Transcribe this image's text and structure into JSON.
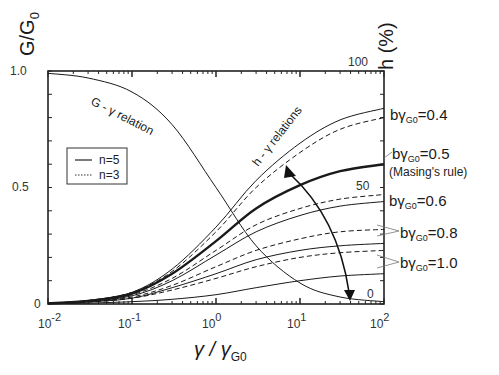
{
  "chart_data": {
    "type": "line",
    "title": "",
    "xlabel": "γ / γG0",
    "xlabel_main": "γ / γ",
    "xlabel_sub": "G0",
    "ylabel_left": "G/G0",
    "ylabel_left_main": "G/G",
    "ylabel_left_sub": "0",
    "ylabel_right": "h (%)",
    "xscale": "log",
    "xlim": [
      0.01,
      100
    ],
    "ylim_left": [
      0,
      1.0
    ],
    "ylim_right": [
      0,
      100
    ],
    "x_ticks": [
      {
        "base": "10",
        "exp": "-2",
        "value": 0.01
      },
      {
        "base": "10",
        "exp": "-1",
        "value": 0.1
      },
      {
        "base": "10",
        "exp": "0",
        "value": 1
      },
      {
        "base": "10",
        "exp": "1",
        "value": 10
      },
      {
        "base": "10",
        "exp": "2",
        "value": 100
      }
    ],
    "y_left_ticks": [
      {
        "label": "1.0",
        "value": 1.0
      },
      {
        "label": "0.5",
        "value": 0.5
      },
      {
        "label": "0",
        "value": 0
      }
    ],
    "y_right_ticks": [
      {
        "label": "100",
        "value": 100
      },
      {
        "label": "50",
        "value": 50
      },
      {
        "label": "0",
        "value": 0
      }
    ],
    "grid": false,
    "legend": {
      "position": "upper-left-inside",
      "entries": [
        {
          "label": "n=5",
          "style": "solid"
        },
        {
          "label": "n=3",
          "style": "dotted"
        }
      ]
    },
    "annotations": {
      "g_curve": "G - γ relation",
      "h_curves": "h - γ relations",
      "masing": "(Masing's rule)"
    },
    "x": [
      0.01,
      0.03,
      0.1,
      0.3,
      1,
      3,
      10,
      30,
      100
    ],
    "series": [
      {
        "name": "G/G0 (G-γ relation)",
        "axis": "left",
        "style": "solid",
        "values": [
          0.99,
          0.97,
          0.91,
          0.77,
          0.5,
          0.25,
          0.09,
          0.03,
          0.01
        ]
      },
      {
        "name": "bγG0=0.4, n=5",
        "axis": "right",
        "style": "solid",
        "values": [
          0.3,
          1.5,
          5,
          15,
          33,
          53,
          69,
          79,
          84
        ]
      },
      {
        "name": "bγG0=0.4, n=3",
        "axis": "right",
        "style": "dashed",
        "values": [
          0.3,
          1.5,
          5,
          14,
          31,
          50,
          65,
          75,
          80
        ]
      },
      {
        "name": "bγG0=0.5 (Masing's rule), n=5",
        "axis": "right",
        "style": "bold",
        "values": [
          0.3,
          1.3,
          4.5,
          13,
          27,
          41,
          51,
          57,
          60
        ]
      },
      {
        "name": "bγG0=0.6, n=5",
        "axis": "right",
        "style": "solid",
        "values": [
          0.2,
          1.1,
          3.5,
          10,
          21,
          31,
          38,
          42,
          44
        ]
      },
      {
        "name": "bγG0=0.6, n=3",
        "axis": "right",
        "style": "dashed",
        "values": [
          0.2,
          1.1,
          4,
          11,
          23,
          34,
          41,
          45,
          47
        ]
      },
      {
        "name": "bγG0=0.8, n=5",
        "axis": "right",
        "style": "solid",
        "values": [
          0.2,
          0.9,
          2.5,
          7,
          13,
          19,
          23,
          25,
          26
        ]
      },
      {
        "name": "bγG0=0.8, n=3",
        "axis": "right",
        "style": "dashed",
        "values": [
          0.2,
          0.9,
          3,
          8,
          16,
          23,
          28,
          31,
          32
        ]
      },
      {
        "name": "bγG0=1.0, n=5",
        "axis": "right",
        "style": "solid",
        "values": [
          0.1,
          0.4,
          1,
          2,
          4,
          7,
          10,
          12,
          13
        ]
      },
      {
        "name": "bγG0=1.0, n=3",
        "axis": "right",
        "style": "dashed",
        "values": [
          0.2,
          0.8,
          2.5,
          6,
          11,
          16,
          20,
          22,
          23
        ]
      }
    ],
    "b_labels": [
      {
        "prefix": "bγ",
        "sub": "G0",
        "value": "=0.4"
      },
      {
        "prefix": "bγ",
        "sub": "G0",
        "value": "=0.5"
      },
      {
        "prefix": "bγ",
        "sub": "G0",
        "value": "=0.6"
      },
      {
        "prefix": "bγ",
        "sub": "G0",
        "value": "=0.8"
      },
      {
        "prefix": "bγ",
        "sub": "G0",
        "value": "=1.0"
      }
    ]
  }
}
